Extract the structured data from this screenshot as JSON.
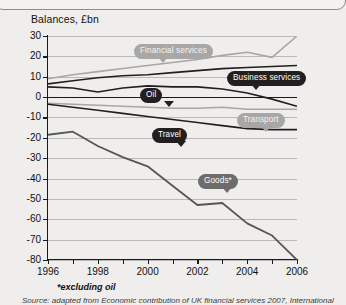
{
  "chart_data": {
    "type": "line",
    "title": "Balances, £bn",
    "xlabel": "",
    "ylabel": "",
    "footnote": "*excluding oil",
    "source": "Source: adapted from Economic contribution of UK financial services 2007, International",
    "grid": true,
    "legend_position": "inline-callouts",
    "xlim": [
      1996,
      2006
    ],
    "ylim": [
      -80,
      30
    ],
    "yticks": [
      30,
      20,
      10,
      0,
      -10,
      -20,
      -30,
      -40,
      -50,
      -60,
      -70,
      -80
    ],
    "xticks": [
      1996,
      1997,
      1998,
      1999,
      2000,
      2001,
      2002,
      2003,
      2004,
      2005,
      2006
    ],
    "xtick_labels": [
      "1996",
      "1998",
      "2000",
      "2002",
      "2004",
      "2006"
    ],
    "x": [
      1996,
      1997,
      1998,
      1999,
      2000,
      2001,
      2002,
      2003,
      2004,
      2005,
      2006
    ],
    "series": [
      {
        "name": "Financial services",
        "color": "#a8a7a5",
        "style": "light",
        "values": [
          9.0,
          11.0,
          12.5,
          14.0,
          15.5,
          17.0,
          18.5,
          20.5,
          22.0,
          19.5,
          30.0
        ]
      },
      {
        "name": "Business services",
        "color": "#231f20",
        "style": "dark",
        "values": [
          6.5,
          8.0,
          9.5,
          10.5,
          11.0,
          12.0,
          13.0,
          14.0,
          14.5,
          15.0,
          15.5
        ]
      },
      {
        "name": "Oil",
        "color": "#231f20",
        "style": "dark",
        "values": [
          5.0,
          4.5,
          2.5,
          4.5,
          5.5,
          5.0,
          5.0,
          4.0,
          2.0,
          -1.0,
          -4.5
        ]
      },
      {
        "name": "Transport",
        "color": "#a8a7a5",
        "style": "light",
        "values": [
          -3.0,
          -3.5,
          -4.0,
          -4.5,
          -5.0,
          -5.5,
          -5.5,
          -5.0,
          -6.0,
          -6.0,
          -6.0
        ]
      },
      {
        "name": "Travel",
        "color": "#231f20",
        "style": "dark",
        "values": [
          -3.5,
          -5.0,
          -6.5,
          -8.0,
          -9.5,
          -11.0,
          -12.5,
          -14.0,
          -15.5,
          -16.0,
          -16.0
        ]
      },
      {
        "name": "Goods*",
        "color": "#565656",
        "style": "mid",
        "values": [
          -18.5,
          -17.0,
          -24.0,
          -29.5,
          -34.0,
          -43.5,
          -53.0,
          -52.0,
          -62.0,
          -68.0,
          -80.0
        ]
      }
    ],
    "callouts": [
      {
        "label": "Financial services",
        "style": "light",
        "x": 134,
        "y": 44
      },
      {
        "label": "Business services",
        "style": "dark",
        "x": 227,
        "y": 71
      },
      {
        "label": "Oil",
        "style": "dark",
        "x": 140,
        "y": 88
      },
      {
        "label": "Transport",
        "style": "light",
        "x": 237,
        "y": 113
      },
      {
        "label": "Travel",
        "style": "dark",
        "x": 152,
        "y": 128
      },
      {
        "label": "Goods*",
        "style": "mid",
        "x": 198,
        "y": 174
      }
    ]
  }
}
